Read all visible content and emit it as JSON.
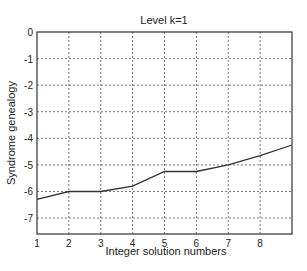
{
  "chart_data": {
    "type": "line",
    "title": "Level k=1",
    "xlabel": "Integer solution numbers",
    "ylabel": "Syndrome genealogy",
    "x": [
      1,
      2,
      3,
      4,
      5,
      6,
      7,
      8,
      9
    ],
    "series": [
      {
        "name": "Syndrome genealogy",
        "values": [
          -6.3,
          -6.0,
          -6.0,
          -5.8,
          -5.25,
          -5.25,
          -5.0,
          -4.65,
          -4.25
        ]
      }
    ],
    "xticks": [
      "1",
      "2",
      "3",
      "4",
      "5",
      "6",
      "7",
      "8"
    ],
    "yticks": [
      "0",
      "-1",
      "-2",
      "-3",
      "-4",
      "-5",
      "-6",
      "-7"
    ],
    "xlim": [
      1,
      9
    ],
    "ylim": [
      -7.6,
      0
    ],
    "grid": true,
    "legend": null
  }
}
